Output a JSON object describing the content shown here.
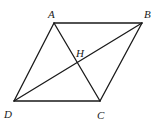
{
  "diagram": {
    "points": {
      "A": {
        "label": "A"
      },
      "B": {
        "label": "B"
      },
      "C": {
        "label": "C"
      },
      "D": {
        "label": "D"
      },
      "H": {
        "label": "H"
      }
    },
    "segments": [
      {
        "name": "AB",
        "from": "A",
        "to": "B"
      },
      {
        "name": "BC",
        "from": "B",
        "to": "C"
      },
      {
        "name": "CD",
        "from": "C",
        "to": "D"
      },
      {
        "name": "DA",
        "from": "D",
        "to": "A"
      },
      {
        "name": "AC",
        "from": "A",
        "to": "C"
      },
      {
        "name": "BD",
        "from": "B",
        "to": "D"
      }
    ],
    "stroke_color": "#1a1a1a"
  }
}
